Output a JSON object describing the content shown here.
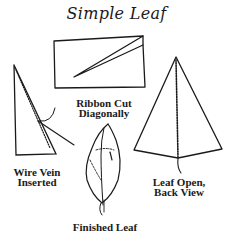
{
  "title": "Simple Leaf",
  "figures": {
    "ribbon": {
      "label_line1": "Ribbon Cut",
      "label_line2": "Diagonally"
    },
    "wire_vein": {
      "label_line1": "Wire Vein",
      "label_line2": "Inserted"
    },
    "leaf_open": {
      "label_line1": "Leaf Open,",
      "label_line2": "Back View"
    },
    "finished": {
      "label": "Finished Leaf"
    }
  },
  "colors": {
    "ink": "#1a1a1a",
    "background": "#ffffff"
  }
}
